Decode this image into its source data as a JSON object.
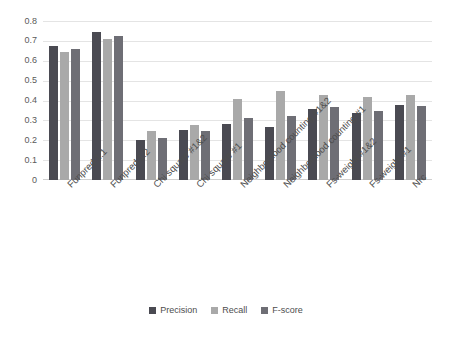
{
  "chart_data": {
    "type": "bar",
    "title": "",
    "xlabel": "",
    "ylabel": "",
    "ylim": [
      0,
      0.8
    ],
    "grid": true,
    "legend_position": "bottom",
    "ytick_labels": [
      "0.8",
      "0.7",
      "0.6",
      "0.5",
      "0.4",
      "0.3",
      "0.2",
      "0.1",
      "0"
    ],
    "ytick_values": [
      0.8,
      0.7,
      0.6,
      0.5,
      0.4,
      0.3,
      0.2,
      0.1,
      0
    ],
    "categories": [
      "Funpred 1.1",
      "Funpred 1.2",
      "Chi square #1&2",
      "Chi square #1",
      "Neighborhood counting #1&2",
      "Neighborhood counting #1",
      "Fs-weight #1&2",
      "Fs-weight #1",
      "Nrc"
    ],
    "series": [
      {
        "name": "Precision",
        "color": "#4a4a52",
        "values": [
          0.675,
          0.745,
          0.2,
          0.25,
          0.28,
          0.265,
          0.355,
          0.335,
          0.375
        ]
      },
      {
        "name": "Recall",
        "color": "#a9a9a9",
        "values": [
          0.645,
          0.71,
          0.245,
          0.275,
          0.41,
          0.45,
          0.43,
          0.42,
          0.43
        ]
      },
      {
        "name": "F-score",
        "color": "#6e6e75",
        "values": [
          0.66,
          0.725,
          0.21,
          0.245,
          0.31,
          0.32,
          0.365,
          0.345,
          0.37
        ]
      }
    ]
  },
  "legend": {
    "items": [
      {
        "label": "Precision"
      },
      {
        "label": "Recall"
      },
      {
        "label": "F-score"
      }
    ]
  }
}
